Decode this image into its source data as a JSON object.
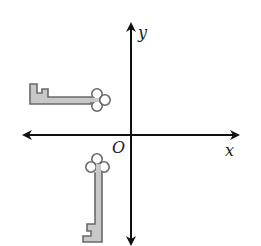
{
  "diagram": {
    "type": "coordinate-plane-transformation",
    "origin_label": "O",
    "x_axis_label": "x",
    "y_axis_label": "y",
    "colors": {
      "axis": "#111111",
      "key_fill": "#c8c8c8",
      "key_outline": "#6a6a6a",
      "background": "#ffffff"
    },
    "figures": [
      {
        "name": "key-horizontal",
        "quadrant": "II",
        "orientation": "horizontal, bow pointing right toward y-axis"
      },
      {
        "name": "key-vertical",
        "quadrant": "III",
        "orientation": "vertical, bow pointing up toward x-axis"
      }
    ]
  }
}
